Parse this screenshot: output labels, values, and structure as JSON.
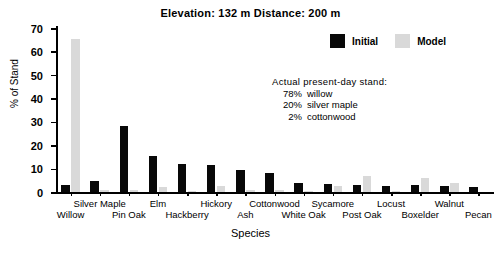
{
  "chart_data": {
    "type": "bar",
    "title": "Elevation: 132 m  Distance: 200 m",
    "xlabel": "Species",
    "ylabel": "% of Stand",
    "ylim": [
      0,
      70
    ],
    "yticks": [
      0,
      10,
      20,
      30,
      40,
      50,
      60,
      70
    ],
    "grid": false,
    "legend_position": "top-right",
    "categories": [
      "Willow",
      "Silver Maple",
      "Pin Oak",
      "Elm",
      "Hackberry",
      "Hickory",
      "Ash",
      "Cottonwood",
      "White Oak",
      "Sycamore",
      "Post Oak",
      "Locust",
      "Boxelder",
      "Walnut",
      "Pecan"
    ],
    "series": [
      {
        "name": "Initial",
        "color": "#080808",
        "values": [
          3,
          4.5,
          28,
          15.5,
          12,
          11.5,
          9.5,
          8,
          4,
          3.5,
          3,
          2.5,
          3,
          2.5,
          2
        ]
      },
      {
        "name": "Model",
        "color": "#d9d9d9",
        "values": [
          65.5,
          1,
          1,
          2,
          0.3,
          2.5,
          0.8,
          1,
          0.5,
          2.5,
          7,
          0.5,
          6,
          4,
          0
        ]
      }
    ],
    "annotation": {
      "heading": "Actual  present-day  stand:",
      "rows": [
        {
          "pct": "78%",
          "name": "willow"
        },
        {
          "pct": "20%",
          "name": "silver maple"
        },
        {
          "pct": "2%",
          "name": "cottonwood"
        }
      ]
    }
  },
  "legend": {
    "entries": [
      {
        "label": "Initial",
        "color": "#080808"
      },
      {
        "label": "Model",
        "color": "#d9d9d9"
      }
    ]
  },
  "axis_labels": {
    "x_top_row": [
      "Silver Maple",
      "Elm",
      "Hickory",
      "Cottonwood",
      "Sycamore",
      "Locust",
      "Walnut"
    ],
    "x_bottom_row": [
      "Willow",
      "Pin Oak",
      "Hackberry",
      "Ash",
      "White Oak",
      "Post Oak",
      "Boxelder",
      "Pecan"
    ]
  }
}
